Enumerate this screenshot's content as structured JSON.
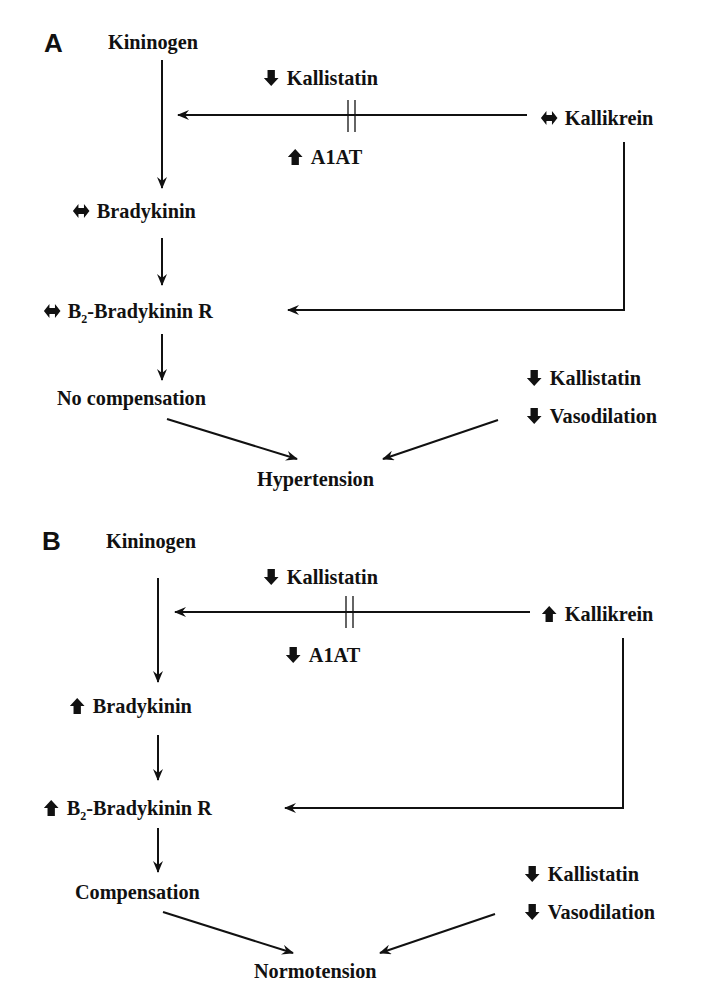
{
  "colors": {
    "ink": "#111111",
    "background": "#ffffff"
  },
  "panels": [
    {
      "label": "A",
      "nodes": {
        "kininogen": {
          "text": "Kininogen",
          "indicator": "none"
        },
        "kallistatin_top": {
          "text": "Kallistatin",
          "indicator": "down-arrow-icon"
        },
        "a1at": {
          "text": "A1AT",
          "indicator": "up-arrow-icon"
        },
        "kallikrein": {
          "text": "Kallikrein",
          "indicator": "left-right-arrow-icon"
        },
        "bradykinin": {
          "text": "Bradykinin",
          "indicator": "left-right-arrow-icon"
        },
        "b2_receptor": {
          "prefix": "B",
          "subscript": "2",
          "suffix": "-Bradykinin R",
          "indicator": "left-right-arrow-icon"
        },
        "compensation": {
          "text": "No compensation",
          "indicator": "none"
        },
        "kallistatin_side": {
          "text": "Kallistatin",
          "indicator": "down-arrow-icon"
        },
        "vasodilation": {
          "text": "Vasodilation",
          "indicator": "down-arrow-icon"
        },
        "outcome": {
          "text": "Hypertension",
          "indicator": "none"
        }
      }
    },
    {
      "label": "B",
      "nodes": {
        "kininogen": {
          "text": "Kininogen",
          "indicator": "none"
        },
        "kallistatin_top": {
          "text": "Kallistatin",
          "indicator": "down-arrow-icon"
        },
        "a1at": {
          "text": "A1AT",
          "indicator": "down-arrow-icon"
        },
        "kallikrein": {
          "text": "Kallikrein",
          "indicator": "up-arrow-icon"
        },
        "bradykinin": {
          "text": "Bradykinin",
          "indicator": "up-arrow-icon"
        },
        "b2_receptor": {
          "prefix": "B",
          "subscript": "2",
          "suffix": "-Bradykinin R",
          "indicator": "up-arrow-icon"
        },
        "compensation": {
          "text": "Compensation",
          "indicator": "none"
        },
        "kallistatin_side": {
          "text": "Kallistatin",
          "indicator": "down-arrow-icon"
        },
        "vasodilation": {
          "text": "Vasodilation",
          "indicator": "down-arrow-icon"
        },
        "outcome": {
          "text": "Normotension",
          "indicator": "none"
        }
      }
    }
  ],
  "edges": [
    "Kininogen -> Bradykinin",
    "Kallikrein -> Kininogen (inhibited by Kallistatin and A1AT)",
    "Bradykinin -> B2-Bradykinin R",
    "Kallikrein -> B2-Bradykinin R",
    "B2-Bradykinin R -> Compensation",
    "Compensation -> Outcome",
    "Kallistatin / Vasodilation -> Outcome"
  ]
}
